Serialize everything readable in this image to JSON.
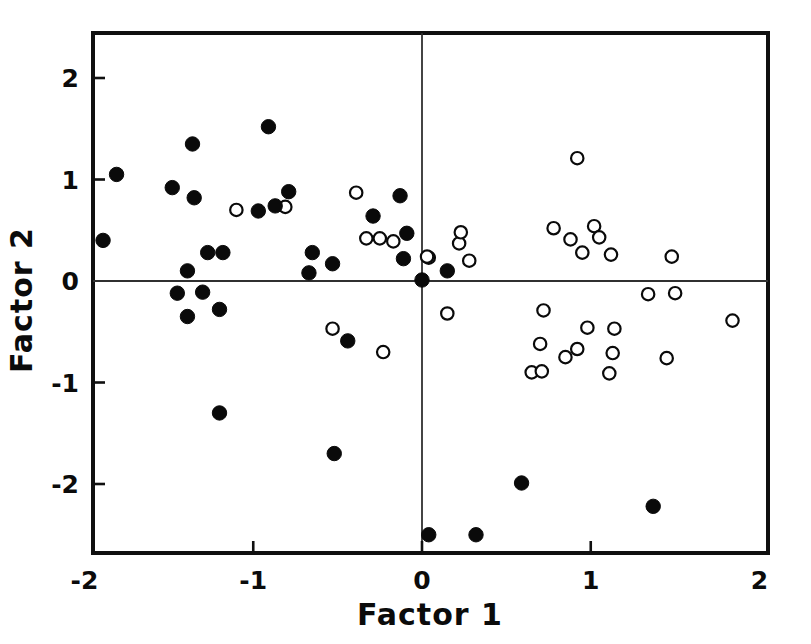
{
  "chart_data": {
    "type": "scatter",
    "title": "",
    "xlabel": "Factor  1",
    "ylabel": "Factor  2",
    "xlim": [
      -2,
      2
    ],
    "ylim": [
      -2.62,
      2.44
    ],
    "xticks": [
      -2,
      -1,
      0,
      1,
      2
    ],
    "xticklabels": [
      "-2",
      "-1",
      "0",
      "1",
      "2"
    ],
    "yticks": [
      2,
      1,
      0,
      -1,
      -2
    ],
    "yticklabels": [
      "2",
      "1",
      "0",
      "-1",
      "-2"
    ],
    "grid": false,
    "legend": "none",
    "reference_lines": {
      "x": 0,
      "y": 0
    },
    "series": [
      {
        "name": "filled",
        "marker": "filled-circle",
        "color": "#0a0a0a",
        "points": [
          [
            -1.89,
            0.4
          ],
          [
            -1.81,
            1.05
          ],
          [
            -1.48,
            0.92
          ],
          [
            -1.45,
            -0.12
          ],
          [
            -1.39,
            0.1
          ],
          [
            -1.39,
            -0.35
          ],
          [
            -1.36,
            1.35
          ],
          [
            -1.35,
            0.82
          ],
          [
            -1.3,
            -0.11
          ],
          [
            -1.27,
            0.28
          ],
          [
            -1.2,
            -1.3
          ],
          [
            -1.2,
            -0.28
          ],
          [
            -1.18,
            0.28
          ],
          [
            -0.97,
            0.69
          ],
          [
            -0.91,
            1.52
          ],
          [
            -0.87,
            0.74
          ],
          [
            -0.79,
            0.88
          ],
          [
            -0.67,
            0.08
          ],
          [
            -0.65,
            0.28
          ],
          [
            -0.53,
            0.17
          ],
          [
            -0.52,
            -1.7
          ],
          [
            -0.44,
            -0.59
          ],
          [
            -0.29,
            0.64
          ],
          [
            -0.13,
            0.84
          ],
          [
            -0.11,
            0.22
          ],
          [
            -0.09,
            0.47
          ],
          [
            0.0,
            0.01
          ],
          [
            0.04,
            -2.5
          ],
          [
            0.15,
            0.1
          ],
          [
            0.32,
            -2.5
          ],
          [
            0.59,
            -1.99
          ],
          [
            1.37,
            -2.22
          ]
        ]
      },
      {
        "name": "open",
        "marker": "open-circle",
        "color": "#0a0a0a",
        "points": [
          [
            -1.1,
            0.7
          ],
          [
            -0.81,
            0.73
          ],
          [
            -0.53,
            -0.47
          ],
          [
            -0.39,
            0.87
          ],
          [
            -0.33,
            0.42
          ],
          [
            -0.25,
            0.42
          ],
          [
            -0.23,
            -0.7
          ],
          [
            -0.17,
            0.39
          ],
          [
            0.04,
            0.23
          ],
          [
            0.15,
            -0.32
          ],
          [
            0.22,
            0.37
          ],
          [
            0.23,
            0.48
          ],
          [
            0.28,
            0.2
          ],
          [
            0.03,
            0.24
          ],
          [
            0.65,
            -0.9
          ],
          [
            0.7,
            -0.62
          ],
          [
            0.71,
            -0.89
          ],
          [
            0.72,
            -0.29
          ],
          [
            0.78,
            0.52
          ],
          [
            0.85,
            -0.75
          ],
          [
            0.88,
            0.41
          ],
          [
            0.92,
            1.21
          ],
          [
            0.92,
            -0.67
          ],
          [
            0.95,
            0.28
          ],
          [
            0.98,
            -0.46
          ],
          [
            1.02,
            0.54
          ],
          [
            1.05,
            0.43
          ],
          [
            1.11,
            -0.91
          ],
          [
            1.12,
            0.26
          ],
          [
            1.13,
            -0.71
          ],
          [
            1.14,
            -0.47
          ],
          [
            1.34,
            -0.13
          ],
          [
            1.45,
            -0.76
          ],
          [
            1.48,
            0.24
          ],
          [
            1.5,
            -0.12
          ],
          [
            1.84,
            -0.39
          ]
        ]
      }
    ]
  }
}
